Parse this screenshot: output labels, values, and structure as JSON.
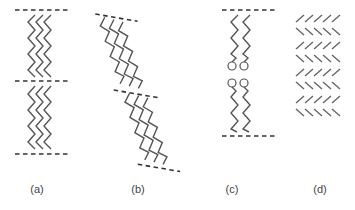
{
  "figure": {
    "panels": [
      {
        "id": "a",
        "label": "(a)",
        "description": "bilayer of straight zigzag chains between three dashed boundaries",
        "label_x": 37
      },
      {
        "id": "b",
        "label": "(b)",
        "description": "tilted bilayer of zigzag chains with diagonal dashed boundaries",
        "label_x": 138
      },
      {
        "id": "c",
        "label": "(c)",
        "description": "two opposing chain layers with circular head groups meeting in the middle",
        "label_x": 232
      },
      {
        "id": "d",
        "label": "(d)",
        "description": "herringbone arrangement of short strokes, 8 alternating rows of 5",
        "label_x": 320
      }
    ],
    "colors": {
      "line": "#555555",
      "dash": "#333333",
      "background": "#ffffff"
    }
  }
}
